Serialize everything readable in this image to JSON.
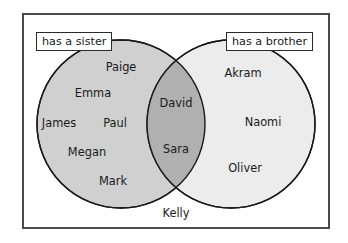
{
  "diagram": {
    "type": "venn-two-set",
    "frame": {
      "visible": true,
      "border_color": "#4a4a4a"
    },
    "sets": {
      "left": {
        "label": "has a sister",
        "fill_color": "#d0d0d0",
        "stroke_color": "#1a1a1a",
        "members": [
          "Paige",
          "Emma",
          "James",
          "Paul",
          "Megan",
          "Mark"
        ]
      },
      "right": {
        "label": "has a brother",
        "fill_color": "#ececec",
        "stroke_color": "#1a1a1a",
        "members": [
          "Akram",
          "Naomi",
          "Oliver"
        ]
      },
      "intersection": {
        "fill_color": "#b0b0b0",
        "members": [
          "David",
          "Sara"
        ]
      },
      "outside": {
        "members": [
          "Kelly"
        ]
      }
    },
    "names": [
      {
        "text": "Paige",
        "region": "left-only",
        "x": 121,
        "y": 68
      },
      {
        "text": "Emma",
        "region": "left-only",
        "x": 93,
        "y": 94
      },
      {
        "text": "James",
        "region": "left-only",
        "x": 59,
        "y": 124
      },
      {
        "text": "Paul",
        "region": "left-only",
        "x": 115,
        "y": 124
      },
      {
        "text": "Megan",
        "region": "left-only",
        "x": 87,
        "y": 153
      },
      {
        "text": "Mark",
        "region": "left-only",
        "x": 113,
        "y": 182
      },
      {
        "text": "David",
        "region": "intersection",
        "x": 176,
        "y": 104
      },
      {
        "text": "Sara",
        "region": "intersection",
        "x": 176,
        "y": 150
      },
      {
        "text": "Akram",
        "region": "right-only",
        "x": 243,
        "y": 74
      },
      {
        "text": "Naomi",
        "region": "right-only",
        "x": 263,
        "y": 123
      },
      {
        "text": "Oliver",
        "region": "right-only",
        "x": 245,
        "y": 169
      },
      {
        "text": "Kelly",
        "region": "outside",
        "x": 176,
        "y": 214
      }
    ]
  }
}
